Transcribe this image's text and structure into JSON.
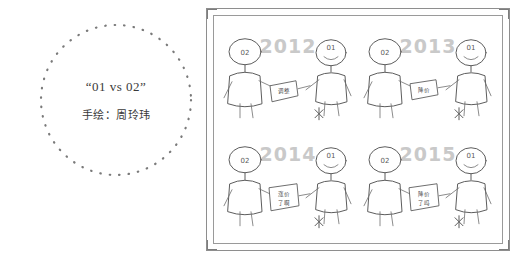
{
  "left_panel": {
    "title": "“01 vs 02”",
    "credit": "手绘：周玲玮",
    "circle_style": "dotted-outline"
  },
  "colors": {
    "ink": "#5d5d5d",
    "frame": "#8e8e8e",
    "year_gray": "#c9c9c9",
    "text": "#3a3a3a",
    "background": "#ffffff"
  },
  "comic": {
    "frame": "double-ruled-border",
    "panels": [
      {
        "id": "panel-2012",
        "year": "2012",
        "left_figure_label": "02",
        "right_figure_label": "01",
        "sign_text": "调整",
        "right_mark": "✳"
      },
      {
        "id": "panel-2013",
        "year": "2013",
        "left_figure_label": "02",
        "right_figure_label": "01",
        "sign_text": "降价",
        "right_mark": "✳"
      },
      {
        "id": "panel-2014",
        "year": "2014",
        "left_figure_label": "02",
        "right_figure_label": "01",
        "sign_text": "涨价\n了啊",
        "sign_line1": "涨价",
        "sign_line2": "了啊",
        "right_mark": "✳"
      },
      {
        "id": "panel-2015",
        "year": "2015",
        "left_figure_label": "02",
        "right_figure_label": "01",
        "sign_line1": "降价",
        "sign_line2": "了吗",
        "right_mark": "✳"
      }
    ]
  }
}
